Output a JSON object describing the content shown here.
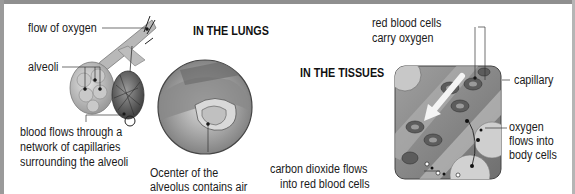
{
  "lungs": {
    "title": "IN THE LUNGS",
    "labels": {
      "flow_of_oxygen": "flow of oxygen",
      "alveoli": "alveoli",
      "blood_flows": [
        "blood flows through a",
        "network of capillaries",
        "surrounding the alveoli"
      ],
      "center_alveolus": [
        "Ocenter of the",
        "alveolus contains air"
      ]
    }
  },
  "tissues": {
    "title": "IN THE TISSUES",
    "labels": {
      "red_blood_cells": [
        "red blood cells",
        "carry oxygen"
      ],
      "capillary": "capillary",
      "oxygen_flows": [
        "oxygen",
        "flows into",
        "body cells"
      ],
      "co2_flows": [
        "carbon dioxide flows",
        "into red blood cells"
      ]
    }
  },
  "colors": {
    "frame": "#8f8f8f",
    "text": "#1a1a1a",
    "illustration_gray": "#9a9a9a",
    "tissue_bg": "#8c8c8c"
  }
}
